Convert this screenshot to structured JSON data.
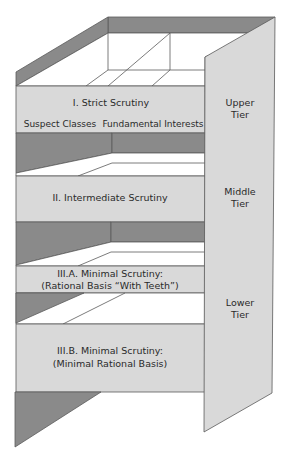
{
  "diagram": {
    "type": "3d-shelf-tiers",
    "colors": {
      "shelf_fill": "#d9d9d9",
      "dark_fill": "#8a8a8a",
      "floor_fill": "#ffffff",
      "stroke": "#5a5a5a"
    },
    "shelves": [
      {
        "id": "strict",
        "title": "I. Strict Scrutiny",
        "sub_labels": [
          "Suspect Classes",
          "Fundamental Interests"
        ]
      },
      {
        "id": "intermediate",
        "title": "II. Intermediate Scrutiny"
      },
      {
        "id": "minimal-a",
        "line1": "III.A. Minimal Scrutiny:",
        "line2": "(Rational Basis “With Teeth”)"
      },
      {
        "id": "minimal-b",
        "line1": "III.B. Minimal Scrutiny:",
        "line2": "(Minimal Rational Basis)"
      }
    ],
    "tiers": [
      {
        "id": "upper",
        "line1": "Upper",
        "line2": "Tier"
      },
      {
        "id": "middle",
        "line1": "Middle",
        "line2": "Tier"
      },
      {
        "id": "lower",
        "line1": "Lower",
        "line2": "Tier"
      }
    ]
  }
}
